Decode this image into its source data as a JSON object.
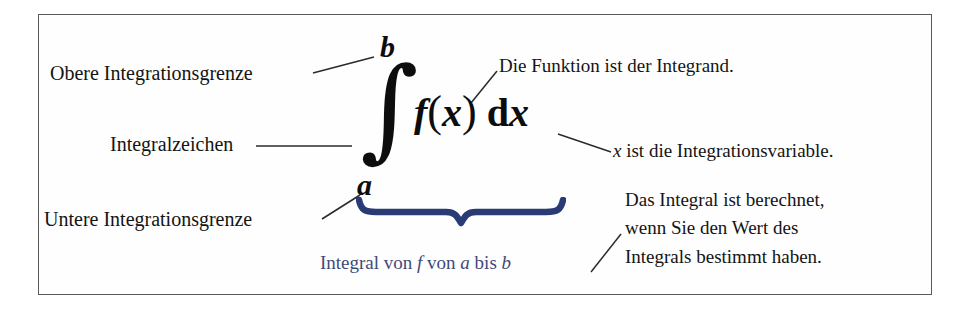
{
  "diagram": {
    "border_color": "#5a5a5a",
    "accent_color": "#2a3a75",
    "caption_color": "#3e4a7a",
    "text_color": "#141414"
  },
  "labels": {
    "upper_limit": "Obere Integrationsgrenze",
    "integral_sign": "Integralzeichen",
    "lower_limit": "Untere Integrationsgrenze",
    "integrand": "Die Funktion ist der Integrand.",
    "variable": "x ist die Integrationsvariable.",
    "computed_line1": "Das Integral ist berechnet,",
    "computed_line2": "wenn Sie den Wert des",
    "computed_line3": "Integrals bestimmt haben."
  },
  "formula": {
    "upper_limit_symbol": "b",
    "lower_limit_symbol": "a",
    "integral_symbol": "∫",
    "function_symbol": "f",
    "open_paren": "(",
    "variable_symbol": "x",
    "close_paren": ")",
    "differential_d": "d",
    "differential_var": "x",
    "plain_text": "∫_a^b f(x) dx"
  },
  "brace_caption": {
    "word_integral": "Integral",
    "word_von_1": "von",
    "symbol_f": "f",
    "word_von_2": "von",
    "symbol_a": "a",
    "word_bis": "bis",
    "symbol_b": "b",
    "full_text": "Integral von f von a bis b"
  },
  "icons": {
    "brace": "underbrace-icon",
    "leader": "leader-line-icon"
  }
}
